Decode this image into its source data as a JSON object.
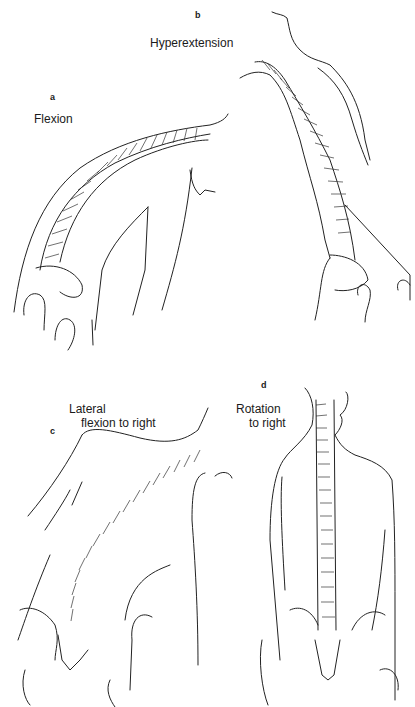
{
  "figure": {
    "panels": [
      {
        "id": "a",
        "letter": "a",
        "caption": "Flexion",
        "caption_lines": [
          "Flexion"
        ]
      },
      {
        "id": "b",
        "letter": "b",
        "caption": "Hyperextension",
        "caption_lines": [
          "Hyperextension"
        ]
      },
      {
        "id": "c",
        "letter": "c",
        "caption": "Lateral flexion to right",
        "caption_lines": [
          "Lateral",
          "flexion to right"
        ]
      },
      {
        "id": "d",
        "letter": "d",
        "caption": "Rotation to right",
        "caption_lines": [
          "Rotation",
          "to right"
        ]
      }
    ],
    "icons": {
      "a": "spine-flexion-illustration",
      "b": "spine-hyperextension-illustration",
      "c": "spine-lateral-flexion-illustration",
      "d": "spine-rotation-illustration"
    },
    "colors": {
      "line": "#222222",
      "background": "#ffffff"
    }
  }
}
